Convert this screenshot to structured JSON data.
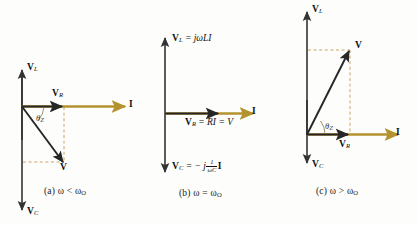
{
  "figure": {
    "colors": {
      "axis": "#333333",
      "current_phasor": "#b3922f",
      "dashed_guide": "#c39a55",
      "text": "#111111"
    },
    "panels": [
      {
        "id": "a",
        "caption": "(a) ω < ω",
        "caption_sub": "O",
        "caption_full": "(a) ω < ωO",
        "vertical_axis_top_label": "V",
        "vertical_axis_top_sub": "L",
        "vertical_axis_bottom_label": "V",
        "vertical_axis_bottom_sub": "C",
        "horizontal_axis_label": "I",
        "resistor_label": "V",
        "resistor_sub": "R",
        "resultant_label": "V",
        "angle_label": "θ",
        "angle_sub": "Z",
        "angle_sign": "negative",
        "description": "V lags below the real axis; capacitive"
      },
      {
        "id": "b",
        "caption": "(b) ω = ω",
        "caption_sub": "O",
        "caption_full": "(b) ω = ωO",
        "vertical_axis_top_label": "V",
        "vertical_axis_top_sub": "L",
        "vertical_axis_top_equation": " = jωLI",
        "vertical_axis_bottom_label": "V",
        "vertical_axis_bottom_sub": "C",
        "vertical_axis_bottom_equation_lead": " = − j",
        "vertical_axis_bottom_fraction_num": "1",
        "vertical_axis_bottom_fraction_den": "ωC",
        "vertical_axis_bottom_equation_tail": "I",
        "horizontal_axis_label": "I",
        "resistor_label": "V",
        "resistor_sub": "R",
        "resistor_equation": " = RI = V",
        "description": "At resonance V is aligned with I"
      },
      {
        "id": "c",
        "caption": "(c) ω > ω",
        "caption_sub": "O",
        "caption_full": "(c) ω > ωO",
        "vertical_axis_top_label": "V",
        "vertical_axis_top_sub": "L",
        "vertical_axis_bottom_label": "V",
        "vertical_axis_bottom_sub": "C",
        "horizontal_axis_label": "I",
        "resistor_label": "V",
        "resistor_sub": "R",
        "resultant_label": "V",
        "angle_label": "θ",
        "angle_sub": "Z",
        "angle_sign": "positive",
        "description": "V leads above the real axis; inductive"
      }
    ]
  }
}
